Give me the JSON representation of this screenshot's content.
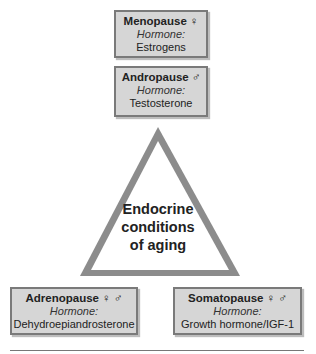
{
  "diagram": {
    "center_label": [
      "Endocrine",
      "conditions",
      "of aging"
    ],
    "boxes": [
      {
        "title": "Menopause",
        "sex_symbols": "♀",
        "hormone_label": "Hormone:",
        "hormone": "Estrogens"
      },
      {
        "title": "Andropause",
        "sex_symbols": "♂",
        "hormone_label": "Hormone:",
        "hormone": "Testosterone"
      },
      {
        "title": "Adrenopause",
        "sex_symbols": "♀ ♂",
        "hormone_label": "Hormone:",
        "hormone": "Dehydroepiandrosterone"
      },
      {
        "title": "Somatopause",
        "sex_symbols": "♀ ♂",
        "hormone_label": "Hormone:",
        "hormone": "Growth hormone/IGF-1"
      }
    ],
    "colors": {
      "box_fill": "#d6d6d6",
      "box_border": "#7a7a7a",
      "triangle_border": "#8c8c8c"
    }
  }
}
